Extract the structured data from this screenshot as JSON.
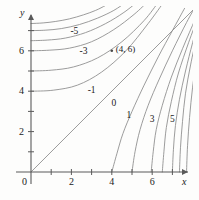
{
  "chart_data": {
    "type": "line",
    "title": "",
    "xlabel": "x",
    "ylabel": "y",
    "xlim": [
      -0.6,
      8.2
    ],
    "ylim": [
      -0.6,
      8.4
    ],
    "xticks": [
      1,
      2,
      3,
      4,
      5,
      6,
      7
    ],
    "yticks": [
      1,
      2,
      3,
      4,
      5,
      6,
      7
    ],
    "xticklabels": [
      {
        "value": 0,
        "text": "0"
      },
      {
        "value": 2,
        "text": "2"
      },
      {
        "value": 4,
        "text": "4"
      },
      {
        "value": 6,
        "text": "6"
      }
    ],
    "yticklabels": [
      {
        "value": 2,
        "text": "2"
      },
      {
        "value": 4,
        "text": "4"
      },
      {
        "value": 6,
        "text": "6"
      }
    ],
    "origin_label": "0",
    "grid": false,
    "legend": null,
    "contours": [
      {
        "level": -6,
        "label": "",
        "label_xy": null,
        "points": [
          [
            0.0,
            7.35
          ],
          [
            0.6,
            7.38
          ],
          [
            1.2,
            7.45
          ],
          [
            1.9,
            7.58
          ],
          [
            2.6,
            7.78
          ],
          [
            3.2,
            8.0
          ],
          [
            3.7,
            8.25
          ],
          [
            4.05,
            8.45
          ]
        ]
      },
      {
        "level": -5,
        "label": "-5",
        "label_xy": [
          2.15,
          6.95
        ],
        "points": [
          [
            0.0,
            7.0
          ],
          [
            0.7,
            7.02
          ],
          [
            1.5,
            7.1
          ],
          [
            2.4,
            7.3
          ],
          [
            3.3,
            7.62
          ],
          [
            4.1,
            8.0
          ],
          [
            4.7,
            8.4
          ]
        ]
      },
      {
        "level": -4,
        "label": "",
        "label_xy": null,
        "points": [
          [
            0.0,
            6.5
          ],
          [
            0.8,
            6.53
          ],
          [
            1.7,
            6.63
          ],
          [
            2.7,
            6.9
          ],
          [
            3.7,
            7.35
          ],
          [
            4.6,
            7.9
          ],
          [
            5.3,
            8.45
          ]
        ]
      },
      {
        "level": -3,
        "label": "-3",
        "label_xy": [
          2.6,
          5.95
        ],
        "points": [
          [
            0.0,
            6.0
          ],
          [
            0.9,
            6.03
          ],
          [
            1.9,
            6.13
          ],
          [
            3.0,
            6.45
          ],
          [
            4.1,
            7.05
          ],
          [
            5.1,
            7.8
          ],
          [
            5.8,
            8.45
          ]
        ]
      },
      {
        "level": -2,
        "label": "",
        "label_xy": null,
        "points": [
          [
            0.0,
            5.0
          ],
          [
            1.0,
            5.04
          ],
          [
            2.1,
            5.2
          ],
          [
            3.3,
            5.65
          ],
          [
            4.5,
            6.45
          ],
          [
            5.6,
            7.5
          ],
          [
            6.3,
            8.4
          ]
        ]
      },
      {
        "level": -1,
        "label": "-1",
        "label_xy": [
          3.0,
          4.0
        ],
        "points": [
          [
            0.0,
            4.0
          ],
          [
            1.1,
            4.05
          ],
          [
            2.3,
            4.3
          ],
          [
            3.5,
            4.95
          ],
          [
            4.7,
            6.0
          ],
          [
            5.8,
            7.35
          ],
          [
            6.6,
            8.45
          ]
        ]
      },
      {
        "level": 0,
        "label": "0",
        "label_xy": [
          4.1,
          3.35
        ],
        "points": [
          [
            0.0,
            0.0
          ],
          [
            8.3,
            8.3
          ]
        ]
      },
      {
        "level": 1,
        "label": "1",
        "label_xy": [
          4.85,
          2.75
        ],
        "points": [
          [
            4.0,
            0.0
          ],
          [
            4.25,
            0.9
          ],
          [
            4.55,
            1.9
          ],
          [
            5.0,
            3.0
          ],
          [
            5.6,
            4.3
          ],
          [
            6.3,
            5.7
          ],
          [
            7.0,
            7.0
          ],
          [
            7.6,
            8.1
          ]
        ]
      },
      {
        "level": 2,
        "label": "",
        "label_xy": null,
        "points": [
          [
            5.0,
            0.0
          ],
          [
            5.15,
            1.0
          ],
          [
            5.4,
            2.1
          ],
          [
            5.8,
            3.3
          ],
          [
            6.35,
            4.6
          ],
          [
            7.0,
            6.0
          ],
          [
            7.7,
            7.4
          ],
          [
            8.2,
            8.3
          ]
        ]
      },
      {
        "level": 3,
        "label": "3",
        "label_xy": [
          6.0,
          2.55
        ],
        "points": [
          [
            5.95,
            0.0
          ],
          [
            6.05,
            1.0
          ],
          [
            6.2,
            2.1
          ],
          [
            6.5,
            3.3
          ],
          [
            6.95,
            4.7
          ],
          [
            7.5,
            6.1
          ],
          [
            8.1,
            7.5
          ]
        ]
      },
      {
        "level": 4,
        "label": "",
        "label_xy": null,
        "points": [
          [
            6.5,
            0.0
          ],
          [
            6.58,
            1.0
          ],
          [
            6.7,
            2.2
          ],
          [
            6.95,
            3.5
          ],
          [
            7.3,
            4.9
          ],
          [
            7.8,
            6.4
          ],
          [
            8.25,
            7.6
          ]
        ]
      },
      {
        "level": 5,
        "label": "5",
        "label_xy": [
          7.0,
          2.55
        ],
        "points": [
          [
            7.0,
            0.0
          ],
          [
            7.05,
            1.1
          ],
          [
            7.15,
            2.3
          ],
          [
            7.35,
            3.6
          ],
          [
            7.65,
            5.0
          ],
          [
            8.0,
            6.4
          ],
          [
            8.3,
            7.5
          ]
        ]
      },
      {
        "level": 6,
        "label": "",
        "label_xy": null,
        "points": [
          [
            7.35,
            0.0
          ],
          [
            7.4,
            1.2
          ],
          [
            7.5,
            2.5
          ],
          [
            7.65,
            3.9
          ],
          [
            7.9,
            5.3
          ],
          [
            8.2,
            6.7
          ]
        ]
      },
      {
        "level": 7,
        "label": "",
        "label_xy": null,
        "points": [
          [
            7.7,
            0.0
          ],
          [
            7.75,
            1.3
          ],
          [
            7.85,
            2.7
          ],
          [
            8.0,
            4.2
          ],
          [
            8.2,
            5.6
          ]
        ]
      }
    ],
    "points": [
      {
        "x": 4,
        "y": 6,
        "label": "(4, 6)",
        "marker": "dot"
      }
    ],
    "colors": {
      "background": "#fdfdfc",
      "axis": "#5a5a5a",
      "contour": "#8a8a8a",
      "text": "#1a1a1a",
      "marker": "#4a4a4a"
    }
  }
}
